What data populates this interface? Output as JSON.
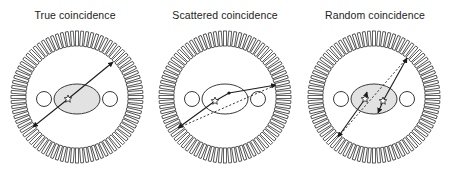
{
  "figure": {
    "colors": {
      "stroke": "#3a3a3a",
      "ring_fill": "#ffffff",
      "patient_fill": "#e2e2e2",
      "line": "#1a1a1a"
    },
    "ring": {
      "outer_radius": 66,
      "inner_radius": 51,
      "block_count": 80
    },
    "panels": [
      {
        "id": "true",
        "title": "True coincidence",
        "offset_x": 0,
        "center": [
          77,
          97
        ],
        "event_star": [
          68,
          99
        ],
        "solid_lines": [
          {
            "from": [
              68,
              99
            ],
            "to": [
              113,
              62
            ],
            "arrow_end": true
          },
          {
            "from": [
              68,
              99
            ],
            "to": [
              33,
              127
            ],
            "arrow_end": true
          }
        ],
        "dashed_lines": [],
        "scatter_points": []
      },
      {
        "id": "scattered",
        "title": "Scattered coincidence",
        "offset_x": 150,
        "center": [
          225,
          97
        ],
        "event_star": [
          215,
          101
        ],
        "solid_lines": [
          {
            "from": [
              215,
              101
            ],
            "to": [
              178,
              128
            ],
            "arrow_end": true
          },
          {
            "from": [
              215,
              101
            ],
            "to": [
              229,
              93
            ],
            "arrow_end": false
          },
          {
            "from": [
              229,
              93
            ],
            "to": [
              276,
              85
            ],
            "arrow_end": true
          }
        ],
        "dashed_lines": [
          {
            "from": [
              178,
              128
            ],
            "to": [
              276,
              85
            ]
          }
        ],
        "scatter_points": [
          [
            229,
            93
          ]
        ]
      },
      {
        "id": "random",
        "title": "Random coincidence",
        "offset_x": 300,
        "center": [
          374,
          97
        ],
        "event_star": [
          383,
          101
        ],
        "event_star_2": [
          365,
          99
        ],
        "solid_lines": [
          {
            "from": [
              383,
              101
            ],
            "to": [
              407,
              58
            ],
            "arrow_end": true
          },
          {
            "from": [
              383,
              101
            ],
            "to": [
              378,
              113
            ],
            "arrow_end": true
          },
          {
            "from": [
              365,
              99
            ],
            "to": [
              367,
              92
            ],
            "arrow_end": true
          },
          {
            "from": [
              365,
              99
            ],
            "to": [
              338,
              137
            ],
            "arrow_end": true
          }
        ],
        "dashed_lines": [
          {
            "from": [
              338,
              137
            ],
            "to": [
              407,
              58
            ]
          }
        ],
        "scatter_points": []
      }
    ]
  }
}
